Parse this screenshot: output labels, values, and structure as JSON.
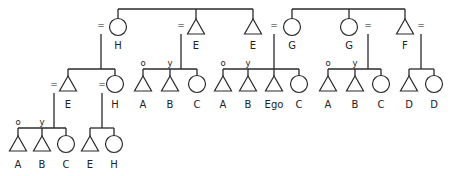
{
  "diagram": {
    "colors": {
      "stroke": "#2a2a2a",
      "text": "#222222",
      "background": "#ffffff"
    },
    "marriage_symbol": "=",
    "age_markers": {
      "older": "o",
      "younger": "y"
    },
    "generations": [
      {
        "level": 1,
        "sibling_groups": [
          {
            "bar": {
              "x1": 118,
              "x2": 253,
              "y": 9
            },
            "members": [
              {
                "id": "g1-H",
                "sex": "female",
                "label": "H",
                "x": 118,
                "married": true,
                "eq_side": "left",
                "line_x": 101
              },
              {
                "id": "g1-E1",
                "sex": "male",
                "label": "E",
                "x": 196,
                "married": true,
                "eq_side": "left",
                "line_x": 181
              },
              {
                "id": "g1-E2",
                "sex": "male",
                "label": "E",
                "x": 253,
                "married": false
              }
            ]
          },
          {
            "bar": {
              "x1": 292,
              "x2": 405,
              "y": 9
            },
            "members": [
              {
                "id": "g1-G1",
                "sex": "female",
                "label": "G",
                "x": 292,
                "married": true,
                "eq_side": "left",
                "line_x": 274
              },
              {
                "id": "g1-G2",
                "sex": "female",
                "label": "G",
                "x": 349,
                "married": true,
                "eq_side": "right",
                "line_x": 368
              },
              {
                "id": "g1-F",
                "sex": "male",
                "label": "F",
                "x": 405,
                "married": true,
                "eq_side": "right",
                "line_x": 421
              }
            ]
          }
        ]
      },
      {
        "level": 2,
        "sibling_groups": [
          {
            "parent_line_x": 101,
            "bar": {
              "x1": 68,
              "x2": 115,
              "y": 69
            },
            "members": [
              {
                "id": "g2-E",
                "sex": "male",
                "label": "E",
                "x": 68,
                "married": true,
                "eq_side": "left",
                "line_x": 54
              },
              {
                "id": "g2-H",
                "sex": "female",
                "label": "H",
                "x": 115,
                "married": true,
                "eq_side": "left",
                "line_x": 102
              }
            ]
          },
          {
            "parent_line_x": 181,
            "bar": {
              "x1": 143,
              "x2": 197,
              "y": 69
            },
            "members": [
              {
                "id": "g2a-A",
                "sex": "male",
                "label": "A",
                "x": 143,
                "age": "o"
              },
              {
                "id": "g2a-B",
                "sex": "male",
                "label": "B",
                "x": 170,
                "age": "y"
              },
              {
                "id": "g2a-C",
                "sex": "female",
                "label": "C",
                "x": 197
              }
            ]
          },
          {
            "parent_line_x": 274,
            "bar": {
              "x1": 223,
              "x2": 299,
              "y": 69
            },
            "members": [
              {
                "id": "g2b-A",
                "sex": "male",
                "label": "A",
                "x": 223,
                "age": "o"
              },
              {
                "id": "g2b-B",
                "sex": "male",
                "label": "B",
                "x": 248,
                "age": "y"
              },
              {
                "id": "g2b-Ego",
                "sex": "male",
                "label": "Ego",
                "x": 274
              },
              {
                "id": "g2b-C",
                "sex": "female",
                "label": "C",
                "x": 299
              }
            ]
          },
          {
            "parent_line_x": 368,
            "bar": {
              "x1": 328,
              "x2": 381,
              "y": 69
            },
            "members": [
              {
                "id": "g2c-A",
                "sex": "male",
                "label": "A",
                "x": 328,
                "age": "o"
              },
              {
                "id": "g2c-B",
                "sex": "male",
                "label": "B",
                "x": 355,
                "age": "y"
              },
              {
                "id": "g2c-C",
                "sex": "female",
                "label": "C",
                "x": 381
              }
            ]
          },
          {
            "parent_line_x": 421,
            "bar": {
              "x1": 409,
              "x2": 434,
              "y": 69
            },
            "members": [
              {
                "id": "g2d-D1",
                "sex": "male",
                "label": "D",
                "x": 409
              },
              {
                "id": "g2d-D2",
                "sex": "female",
                "label": "D",
                "x": 434
              }
            ]
          }
        ]
      },
      {
        "level": 3,
        "sibling_groups": [
          {
            "parent_line_x": 54,
            "bar": {
              "x1": 18,
              "x2": 66,
              "y": 128
            },
            "members": [
              {
                "id": "g3a-A",
                "sex": "male",
                "label": "A",
                "x": 18,
                "age": "o"
              },
              {
                "id": "g3a-B",
                "sex": "male",
                "label": "B",
                "x": 42,
                "age": "y"
              },
              {
                "id": "g3a-C",
                "sex": "female",
                "label": "C",
                "x": 66
              }
            ]
          },
          {
            "parent_line_x": 102,
            "bar": {
              "x1": 90,
              "x2": 114,
              "y": 128
            },
            "members": [
              {
                "id": "g3b-E",
                "sex": "male",
                "label": "E",
                "x": 90
              },
              {
                "id": "g3b-H",
                "sex": "female",
                "label": "H",
                "x": 114
              }
            ]
          }
        ]
      }
    ]
  }
}
